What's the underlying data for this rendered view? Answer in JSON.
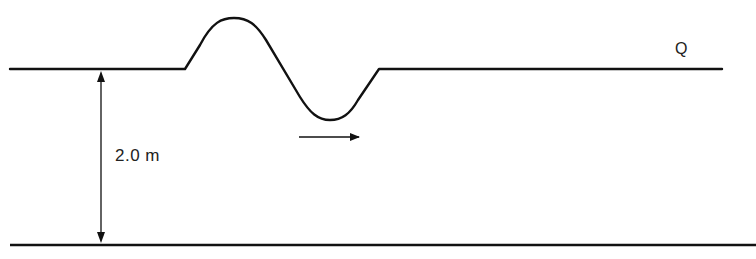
{
  "diagram": {
    "type": "water-wave-cross-section",
    "labels": {
      "point": "Q",
      "depth": "2.0 m"
    },
    "elements": {
      "surface_line": "water surface with wave crest and trough",
      "bottom_line": "sea bed",
      "depth_arrow": "double-headed vertical dimension arrow",
      "direction_arrow": "wave travel direction, pointing right"
    },
    "colors": {
      "stroke": "#111111",
      "background": "#ffffff"
    }
  }
}
